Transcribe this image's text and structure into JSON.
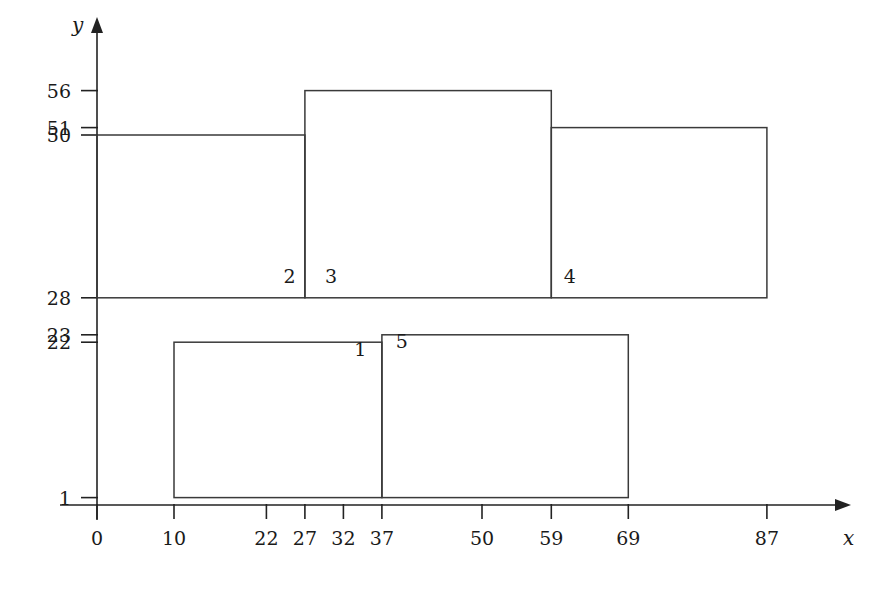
{
  "figure": {
    "title": "",
    "background_color": "#ffffff",
    "line_color": "#3a3a3a",
    "axis_color": "#222222",
    "text_color": "#1a1a1a"
  },
  "axes": {
    "x": {
      "name": "x",
      "ticks": [
        {
          "value": 0,
          "label": "0"
        },
        {
          "value": 10,
          "label": "10"
        },
        {
          "value": 22,
          "label": "22"
        },
        {
          "value": 27,
          "label": "27"
        },
        {
          "value": 32,
          "label": "32"
        },
        {
          "value": 37,
          "label": "37"
        },
        {
          "value": 50,
          "label": "50"
        },
        {
          "value": 59,
          "label": "59"
        },
        {
          "value": 69,
          "label": "69"
        },
        {
          "value": 87,
          "label": "87"
        }
      ],
      "range": [
        0,
        97
      ]
    },
    "y": {
      "name": "y",
      "ticks": [
        {
          "value": 1,
          "label": "1"
        },
        {
          "value": 22,
          "label": "22"
        },
        {
          "value": 23,
          "label": "23"
        },
        {
          "value": 28,
          "label": "28"
        },
        {
          "value": 50,
          "label": "50"
        },
        {
          "value": 51,
          "label": "51"
        },
        {
          "value": 56,
          "label": "56"
        }
      ],
      "range": [
        0,
        62
      ]
    }
  },
  "chart_data": {
    "type": "diagram",
    "title": "",
    "xlabel": "x",
    "ylabel": "y",
    "grid": false,
    "xlim": [
      0,
      97
    ],
    "ylim": [
      0,
      62
    ],
    "rectangles": [
      {
        "label": "1",
        "x0": 10,
        "x1": 37,
        "y0": 1,
        "y1": 22,
        "label_x": 34.2,
        "label_y": 20.2
      },
      {
        "label": "2",
        "x0": 0,
        "x1": 27,
        "y0": 28,
        "y1": 50,
        "label_x": 25.0,
        "label_y": 30.0
      },
      {
        "label": "3",
        "x0": 27,
        "x1": 59,
        "y0": 28,
        "y1": 56,
        "label_x": 30.4,
        "label_y": 30.0
      },
      {
        "label": "4",
        "x0": 59,
        "x1": 87,
        "y0": 28,
        "y1": 51,
        "label_x": 61.4,
        "label_y": 30.0
      },
      {
        "label": "5",
        "x0": 37,
        "x1": 69,
        "y0": 1,
        "y1": 23,
        "label_x": 39.6,
        "label_y": 21.2
      }
    ]
  }
}
